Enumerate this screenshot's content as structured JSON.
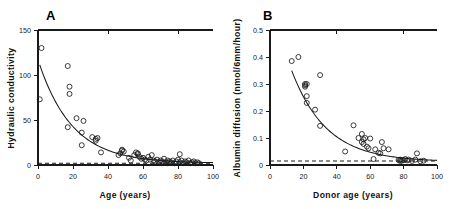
{
  "figure": {
    "background": "#ffffff",
    "ink_color": "#1a1a1a",
    "panels": [
      "A",
      "B"
    ]
  },
  "chart_data": [
    {
      "type": "scatter",
      "panel_label": "A",
      "title": "",
      "xlabel": "Age (years)",
      "ylabel": "Hydraulic conductivity",
      "xlim": [
        0,
        100
      ],
      "ylim": [
        0,
        150
      ],
      "xticks": [
        0,
        20,
        40,
        60,
        80,
        100
      ],
      "yticks": [
        0,
        50,
        100,
        150
      ],
      "grid": false,
      "legend": "none",
      "marker": "open-circle",
      "points": [
        [
          1,
          73
        ],
        [
          2,
          130
        ],
        [
          17,
          42
        ],
        [
          17,
          110
        ],
        [
          18,
          87
        ],
        [
          18,
          79
        ],
        [
          22,
          52
        ],
        [
          25,
          36
        ],
        [
          25,
          22
        ],
        [
          26,
          49
        ],
        [
          31,
          31
        ],
        [
          33,
          27
        ],
        [
          33,
          29
        ],
        [
          34,
          30
        ],
        [
          36,
          14
        ],
        [
          46,
          11
        ],
        [
          47,
          13
        ],
        [
          48,
          17
        ],
        [
          48,
          16
        ],
        [
          49,
          15
        ],
        [
          52,
          8
        ],
        [
          53,
          5
        ],
        [
          55,
          11
        ],
        [
          56,
          14
        ],
        [
          57,
          13
        ],
        [
          57,
          12
        ],
        [
          58,
          9
        ],
        [
          59,
          7
        ],
        [
          60,
          8
        ],
        [
          61,
          6
        ],
        [
          62,
          5
        ],
        [
          63,
          9
        ],
        [
          64,
          6
        ],
        [
          65,
          11
        ],
        [
          66,
          5
        ],
        [
          67,
          4
        ],
        [
          68,
          6
        ],
        [
          69,
          3
        ],
        [
          70,
          5
        ],
        [
          71,
          4
        ],
        [
          72,
          7
        ],
        [
          72,
          2
        ],
        [
          73,
          3
        ],
        [
          74,
          5
        ],
        [
          74,
          2
        ],
        [
          75,
          4
        ],
        [
          76,
          3
        ],
        [
          77,
          5
        ],
        [
          78,
          2
        ],
        [
          79,
          4
        ],
        [
          80,
          6
        ],
        [
          81,
          12
        ],
        [
          81,
          3
        ],
        [
          82,
          5
        ],
        [
          83,
          2
        ],
        [
          84,
          4
        ],
        [
          85,
          3
        ],
        [
          86,
          5
        ],
        [
          87,
          2
        ],
        [
          88,
          3
        ],
        [
          89,
          4
        ],
        [
          90,
          2
        ],
        [
          91,
          3
        ],
        [
          92,
          2
        ]
      ],
      "fit_curve": {
        "description": "exponential decay fit",
        "type": "exponential",
        "amplitude": 115,
        "decay_rate": 0.052,
        "offset": 2
      },
      "reference_line": {
        "style": "dashed",
        "value": 2,
        "description": "baseline reference"
      }
    },
    {
      "type": "scatter",
      "panel_label": "B",
      "title": "",
      "xlabel": "Donor age (years)",
      "ylabel": "Albumin diffusion (nmol/6mm/hour)",
      "xlim": [
        0,
        100
      ],
      "ylim": [
        0,
        0.5
      ],
      "xticks": [
        0,
        20,
        40,
        60,
        80,
        100
      ],
      "yticks": [
        0,
        0.1,
        0.2,
        0.3,
        0.4,
        0.5
      ],
      "grid": false,
      "legend": "none",
      "marker": "open-circle",
      "points": [
        [
          13,
          0.385
        ],
        [
          17,
          0.4
        ],
        [
          21,
          0.295
        ],
        [
          21,
          0.3
        ],
        [
          21,
          0.29
        ],
        [
          22,
          0.3
        ],
        [
          22,
          0.255
        ],
        [
          22,
          0.23
        ],
        [
          27,
          0.205
        ],
        [
          30,
          0.333
        ],
        [
          30,
          0.145
        ],
        [
          45,
          0.05
        ],
        [
          50,
          0.147
        ],
        [
          53,
          0.1
        ],
        [
          55,
          0.115
        ],
        [
          55,
          0.085
        ],
        [
          56,
          0.095
        ],
        [
          56,
          0.078
        ],
        [
          57,
          0.1
        ],
        [
          58,
          0.068
        ],
        [
          59,
          0.062
        ],
        [
          60,
          0.098
        ],
        [
          62,
          0.022
        ],
        [
          63,
          0.058
        ],
        [
          65,
          0.045
        ],
        [
          66,
          0.043
        ],
        [
          67,
          0.085
        ],
        [
          68,
          0.062
        ],
        [
          71,
          0.058
        ],
        [
          77,
          0.018
        ],
        [
          78,
          0.015
        ],
        [
          78,
          0.02
        ],
        [
          79,
          0.016
        ],
        [
          80,
          0.018
        ],
        [
          81,
          0.022
        ],
        [
          82,
          0.017
        ],
        [
          83,
          0.02
        ],
        [
          85,
          0.015
        ],
        [
          87,
          0.02
        ],
        [
          88,
          0.043
        ],
        [
          90,
          0.014
        ],
        [
          92,
          0.016
        ]
      ],
      "fit_curve": {
        "description": "exponential decay fit",
        "type": "exponential",
        "amplitude": 0.63,
        "decay_rate": 0.048,
        "offset": 0.012
      },
      "reference_line": {
        "style": "dashed",
        "value": 0.015,
        "description": "baseline reference"
      }
    }
  ]
}
